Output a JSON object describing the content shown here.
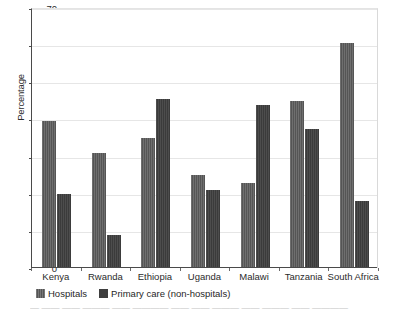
{
  "chart_data": {
    "type": "bar",
    "title": "",
    "xlabel": "",
    "ylabel": "Percentage",
    "ylim": [
      0,
      70
    ],
    "ytick_step": 10,
    "yticks": [
      0,
      10,
      20,
      30,
      40,
      50,
      60,
      70
    ],
    "grid": true,
    "legend_position": "bottom-left",
    "categories": [
      "Kenya",
      "Rwanda",
      "Ethiopia",
      "Uganda",
      "Malawi",
      "Tanzania",
      "South Africa"
    ],
    "series": [
      {
        "name": "Hospitals",
        "color": "#5a5a5a",
        "values": [
          39.5,
          31,
          35,
          25,
          23,
          45,
          60.5
        ]
      },
      {
        "name": "Primary care (non-hospitals)",
        "color": "#3e3e3e",
        "values": [
          20,
          9,
          45.5,
          21,
          44,
          37.5,
          18
        ]
      }
    ]
  },
  "footer": {
    "clipped_caption": "— —— —— ——— —— ———— —— —— ——— —— ——— —— ————"
  }
}
